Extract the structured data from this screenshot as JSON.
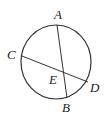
{
  "diagram": {
    "type": "circle-intersecting-chords",
    "stroke_color": "#333333",
    "circle": {
      "cx": 56,
      "cy": 62,
      "rx": 35,
      "ry": 37
    },
    "points": [
      {
        "name": "A",
        "x": 57,
        "y": 25,
        "label_x": 54,
        "label_y": 19
      },
      {
        "name": "B",
        "x": 67,
        "y": 98,
        "label_x": 62,
        "label_y": 112
      },
      {
        "name": "C",
        "x": 22,
        "y": 56,
        "label_x": 7,
        "label_y": 59
      },
      {
        "name": "D",
        "x": 88,
        "y": 82,
        "label_x": 90,
        "label_y": 92
      },
      {
        "name": "E",
        "x": 63,
        "y": 73,
        "label_x": 49,
        "label_y": 84
      }
    ],
    "chords": [
      {
        "name": "AB",
        "from": "A",
        "to": "B"
      },
      {
        "name": "CD",
        "from": "C",
        "to": "D"
      }
    ],
    "labels": {
      "A": "A",
      "B": "B",
      "C": "C",
      "D": "D",
      "E": "E"
    }
  }
}
